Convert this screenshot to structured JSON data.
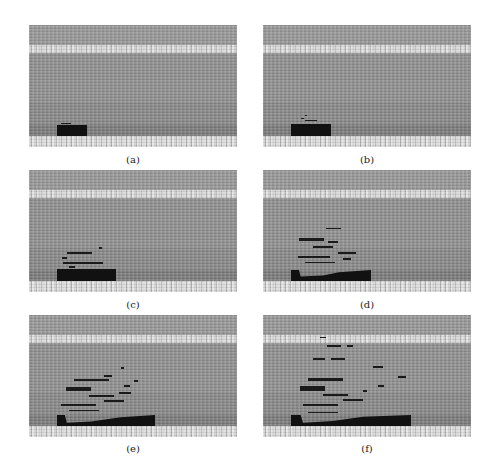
{
  "figure": {
    "panels": [
      {
        "id": "a",
        "label": "(a)",
        "stage": "initial fire region at bottom-left"
      },
      {
        "id": "b",
        "label": "(b)",
        "stage": "slight growth with small fragments above"
      },
      {
        "id": "c",
        "label": "(c)",
        "stage": "larger region with layered streaks"
      },
      {
        "id": "d",
        "label": "(d)",
        "stage": "expanded region with multiple streaks"
      },
      {
        "id": "e",
        "label": "(e)",
        "stage": "widespread spread upward and rightward"
      },
      {
        "id": "f",
        "label": "(f)",
        "stage": "largest extent with scattered fragments reaching top band"
      }
    ],
    "colors": {
      "background": "#8d8d8d",
      "bright_band": "#c9c9c9",
      "fire_region": "#111111",
      "caption_text": "#222222"
    }
  }
}
